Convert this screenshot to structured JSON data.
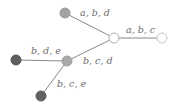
{
  "diagram": {
    "type": "tree",
    "nodes": [
      {
        "id": "top",
        "x": 65,
        "y": 13,
        "fill": "#a3a3a3",
        "stroke": "#9a9a9a"
      },
      {
        "id": "center",
        "x": 114,
        "y": 38,
        "fill": "#ffffff",
        "stroke": "#b0b0b0"
      },
      {
        "id": "right",
        "x": 162,
        "y": 38,
        "fill": "#ffffff",
        "stroke": "#c4c4c4"
      },
      {
        "id": "middle",
        "x": 67,
        "y": 61,
        "fill": "#a8a8a8",
        "stroke": "#a0a0a0"
      },
      {
        "id": "left",
        "x": 16,
        "y": 60,
        "fill": "#5e5e5e",
        "stroke": "#555555"
      },
      {
        "id": "bottom",
        "x": 41,
        "y": 96,
        "fill": "#626262",
        "stroke": "#595959"
      }
    ],
    "edges": [
      {
        "from": "top",
        "to": "center",
        "label": "a, b, d",
        "lx": 80,
        "ly": 16
      },
      {
        "from": "center",
        "to": "right",
        "label": "a, b, c",
        "lx": 126,
        "ly": 33
      },
      {
        "from": "center",
        "to": "middle",
        "label": "b, c, d",
        "lx": 83,
        "ly": 64
      },
      {
        "from": "middle",
        "to": "left",
        "label": "b, d, e",
        "lx": 31,
        "ly": 54
      },
      {
        "from": "middle",
        "to": "bottom",
        "label": "b, c, e",
        "lx": 57,
        "ly": 87
      }
    ]
  }
}
